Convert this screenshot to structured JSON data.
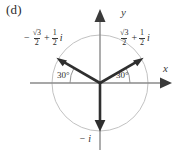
{
  "figure": {
    "part_label": "(d)",
    "type": "complex-plane-argand-diagram",
    "axes": {
      "x_label": "x",
      "y_label": "y"
    },
    "unit_circle": {
      "radius_label": "1",
      "visible": true,
      "color": "#b9b9b9"
    },
    "angles": [
      {
        "name": "left-angle",
        "text": "30°"
      },
      {
        "name": "right-angle",
        "text": "30°"
      }
    ],
    "vectors": [
      {
        "name": "vector-upper-left",
        "angle_deg": 150,
        "label": {
          "minus": "−",
          "real_num": "√3",
          "real_den": "2",
          "plus": "+",
          "imag_num": "1",
          "imag_den": "2",
          "imag_unit": "i"
        }
      },
      {
        "name": "vector-upper-right",
        "angle_deg": 30,
        "label": {
          "minus": "",
          "real_num": "√3",
          "real_den": "2",
          "plus": "+",
          "imag_num": "1",
          "imag_den": "2",
          "imag_unit": "i"
        }
      },
      {
        "name": "vector-down",
        "angle_deg": 270,
        "label": {
          "text": "− i"
        }
      }
    ],
    "colors": {
      "vector": "#2f2f2f",
      "axis": "#7a7a7a",
      "circle": "#bdbdbd",
      "text": "#2b2b2b",
      "background": "#ffffff"
    }
  }
}
